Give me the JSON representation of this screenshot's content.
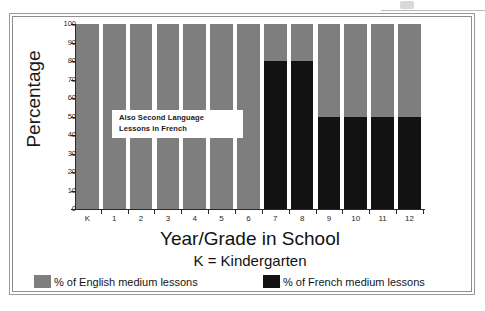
{
  "chart_data": {
    "type": "bar",
    "subtype": "stacked-bar-100-percent",
    "title": "",
    "xlabel": "Year/Grade in School",
    "xsublabel": "K = Kindergarten",
    "ylabel": "Percentage",
    "ylim": [
      0,
      100
    ],
    "yticks": [
      0,
      10,
      20,
      30,
      40,
      50,
      60,
      70,
      80,
      90,
      100
    ],
    "ytick_labels": [
      "0",
      "10",
      "20",
      "30",
      "40",
      "50",
      "60",
      "70",
      "80",
      "90",
      "100"
    ],
    "grid": false,
    "legend_position": "bottom",
    "categories": [
      "K",
      "1",
      "2",
      "3",
      "4",
      "5",
      "6",
      "7",
      "8",
      "9",
      "10",
      "11",
      "12"
    ],
    "series": [
      {
        "name": "% of English medium lessons",
        "color": "#7e7e7e",
        "values": [
          100,
          100,
          100,
          100,
          100,
          100,
          100,
          20,
          20,
          50,
          50,
          50,
          50
        ]
      },
      {
        "name": "% of French medium lessons",
        "color": "#121212",
        "values": [
          0,
          0,
          0,
          0,
          0,
          0,
          0,
          80,
          80,
          50,
          50,
          50,
          50
        ]
      }
    ],
    "annotations": [
      {
        "name": "second-language-note",
        "line1": "Also Second Language",
        "line2": "Lessons in French",
        "x_range": [
          "1",
          "5"
        ],
        "y_value": 45
      }
    ]
  },
  "axes": {
    "y_title": "Percentage",
    "x_title": "Year/Grade in School",
    "x_subtitle": "K = Kindergarten",
    "y_tick_labels": [
      "100",
      "90",
      "80",
      "70",
      "60",
      "50",
      "40",
      "30",
      "20",
      "10",
      "0"
    ],
    "x_tick_labels": [
      "K",
      "1",
      "2",
      "3",
      "4",
      "5",
      "6",
      "7",
      "8",
      "9",
      "10",
      "11",
      "12"
    ]
  },
  "annotation": {
    "line1": "Also Second Language",
    "line2": "Lessons in French"
  },
  "legend": {
    "english": {
      "label": "% of English medium lessons",
      "color": "#7e7e7e"
    },
    "french": {
      "label": "% of French medium lessons",
      "color": "#121212"
    }
  },
  "colors": {
    "english_gray": "#7e7e7e",
    "french_black": "#121212",
    "axis": "#2a2a2a",
    "frame": "#9a9a9a",
    "background": "#ffffff"
  }
}
